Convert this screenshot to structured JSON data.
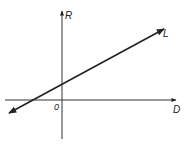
{
  "diagram": {
    "type": "line-graph-sketch",
    "axes": {
      "x_label": "D",
      "y_label": "R",
      "origin_label": "0"
    },
    "line": {
      "label": "L",
      "description": "straight line with positive slope and positive R-intercept, arrows at both ends"
    },
    "colors": {
      "stroke": "#222222",
      "background": "#ffffff"
    }
  }
}
